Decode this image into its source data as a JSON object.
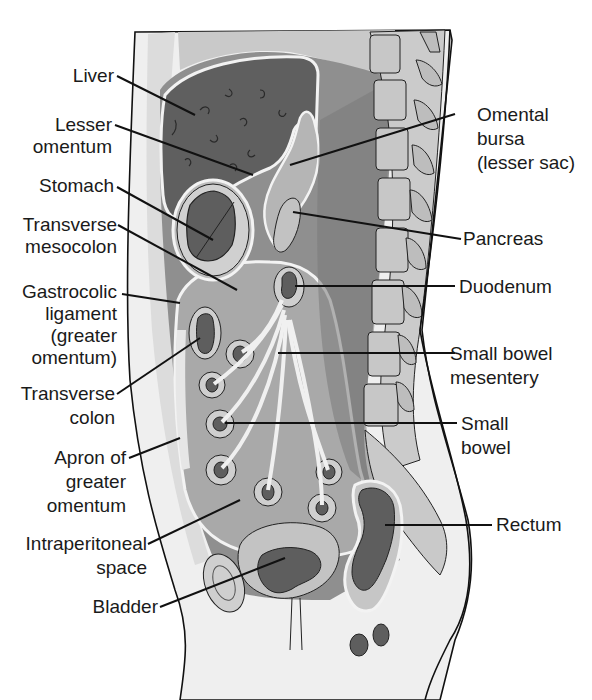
{
  "figure": {
    "colors": {
      "background": "#ffffff",
      "body_wall": "#efefef",
      "light_gray": "#c9c9c9",
      "mid_gray": "#9a9a9a",
      "dark_gray": "#6c6c6c",
      "organ_dark": "#5e5e5e",
      "line": "#111111"
    }
  },
  "labels_left": [
    {
      "id": "liver",
      "lines": [
        "Liver"
      ]
    },
    {
      "id": "lesser-omentum",
      "lines": [
        "Lesser",
        "omentum"
      ]
    },
    {
      "id": "stomach",
      "lines": [
        "Stomach"
      ]
    },
    {
      "id": "transverse-mesocolon",
      "lines": [
        "Transverse",
        "mesocolon"
      ]
    },
    {
      "id": "gastrocolic-ligament",
      "lines": [
        "Gastrocolic",
        "ligament",
        "(greater",
        "omentum)"
      ]
    },
    {
      "id": "transverse-colon",
      "lines": [
        "Transverse",
        "colon"
      ]
    },
    {
      "id": "apron-greater-omentum",
      "lines": [
        "Apron of",
        "greater",
        "omentum"
      ]
    },
    {
      "id": "intraperitoneal-space",
      "lines": [
        "Intraperitoneal",
        "space"
      ]
    },
    {
      "id": "bladder",
      "lines": [
        "Bladder"
      ]
    }
  ],
  "labels_right": [
    {
      "id": "omental-bursa",
      "lines": [
        "Omental",
        "bursa",
        "(lesser sac)"
      ]
    },
    {
      "id": "pancreas",
      "lines": [
        "Pancreas"
      ]
    },
    {
      "id": "duodenum",
      "lines": [
        "Duodenum"
      ]
    },
    {
      "id": "small-bowel-mesentery",
      "lines": [
        "Small bowel",
        "mesentery"
      ]
    },
    {
      "id": "small-bowel",
      "lines": [
        "Small",
        "bowel"
      ]
    },
    {
      "id": "rectum",
      "lines": [
        "Rectum"
      ]
    }
  ]
}
